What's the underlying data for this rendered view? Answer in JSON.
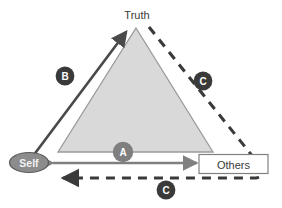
{
  "diagram": {
    "nodes": [
      {
        "id": "truth",
        "label": "Truth",
        "shape": "text",
        "x": 137,
        "y": 14
      },
      {
        "id": "self",
        "label": "Self",
        "shape": "ellipse",
        "x": 29,
        "y": 162
      },
      {
        "id": "others",
        "label": "Others",
        "shape": "rect",
        "x": 233,
        "y": 164
      }
    ],
    "badges": [
      {
        "id": "badge-a",
        "label": "A",
        "x": 123,
        "y": 152,
        "color": "#7f7f7f"
      },
      {
        "id": "badge-b",
        "label": "B",
        "x": 65,
        "y": 76,
        "color": "#3a3a3a"
      },
      {
        "id": "badge-c-right",
        "label": "C",
        "x": 203,
        "y": 81,
        "color": "#3a3a3a"
      },
      {
        "id": "badge-c-bottom",
        "label": "C",
        "x": 166,
        "y": 190,
        "color": "#3a3a3a"
      }
    ],
    "connectors": [
      {
        "id": "arrow-a",
        "style": "solid",
        "heads": "double",
        "color": "#808080",
        "note": "Self to Others horizontal double arrow"
      },
      {
        "id": "arrow-b",
        "style": "solid",
        "heads": "single",
        "color": "#4a4a4a",
        "note": "Self up to Truth apex"
      },
      {
        "id": "arrow-c",
        "style": "dashed",
        "heads": "single",
        "color": "#3a3a3a",
        "note": "Truth apex down right behind Others then left to Self"
      }
    ],
    "shapes": {
      "triangle": {
        "id": "truth-triangle",
        "fill": "#d9d9d9",
        "stroke": "#9a9a9a",
        "apex": [
          136,
          28
        ],
        "base_left": [
          58,
          152
        ],
        "base_right": [
          213,
          152
        ]
      }
    },
    "colors": {
      "triangle_fill": "#d9d9d9",
      "triangle_stroke": "#9a9a9a",
      "badge_dark": "#3a3a3a",
      "badge_mid": "#7f7f7f",
      "self_fill": "#8c8c8c",
      "self_stroke": "#5a5a5a",
      "others_border": "#808080",
      "others_fill": "#ffffff",
      "arrow_gray": "#808080",
      "arrow_dark": "#3a3a3a",
      "text_dark": "#333333",
      "background": "#ffffff"
    }
  }
}
